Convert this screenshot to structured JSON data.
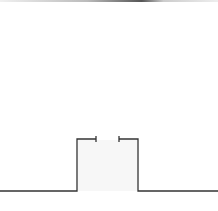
{
  "diagram": {
    "type": "outline-trace",
    "stroke_color": "#333333",
    "fill_color": "#f7f7f7",
    "top_border_color": "#555555",
    "path_points": [
      [
        0,
        191
      ],
      [
        77,
        191
      ],
      [
        77,
        139
      ],
      [
        96,
        139
      ]
    ],
    "path_points_right": [
      [
        119,
        139
      ],
      [
        138,
        139
      ],
      [
        138,
        191
      ],
      [
        218,
        191
      ]
    ],
    "tick_left": {
      "x": 96,
      "y1": 136,
      "y2": 142
    },
    "tick_right": {
      "x": 119,
      "y1": 136,
      "y2": 142
    },
    "labels": []
  }
}
